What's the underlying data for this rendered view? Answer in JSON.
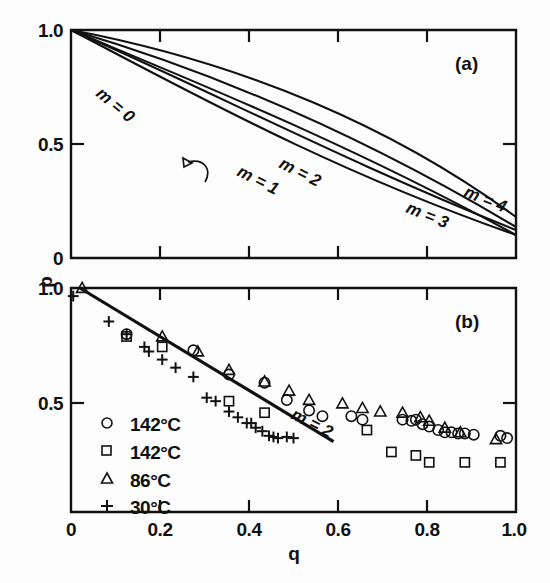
{
  "figure": {
    "panel_a_label": "(a)",
    "panel_b_label": "(b)",
    "y_axis_label": "p",
    "x_axis_label": "q"
  },
  "panel_a": {
    "y_ticks": [
      "1.0",
      "0.5",
      "0"
    ],
    "y_tick_values": [
      1.0,
      0.5,
      0.0
    ],
    "x_tick_values": [
      0.0,
      0.2,
      0.4,
      0.6,
      0.8,
      1.0
    ],
    "curve_labels": [
      "m = 0",
      "m = 1",
      "m = 2",
      "m = 3",
      "m = 4"
    ]
  },
  "panel_b": {
    "y_ticks": [
      "1.0",
      "0.5"
    ],
    "y_tick_values": [
      1.0,
      0.5
    ],
    "x_ticks": [
      "0",
      "0.2",
      "0.4",
      "0.6",
      "0.8",
      "1.0"
    ],
    "x_tick_values": [
      0.0,
      0.2,
      0.4,
      0.6,
      0.8,
      1.0
    ],
    "fit_label": "m = 2",
    "legend": [
      {
        "marker": "circle-marker",
        "label": "142°C"
      },
      {
        "marker": "square-marker",
        "label": "142°C"
      },
      {
        "marker": "triangle-marker",
        "label": "86°C"
      },
      {
        "marker": "plus-marker",
        "label": "30°C"
      }
    ]
  },
  "chart_data": {
    "type": "line",
    "title": "",
    "xlabel": "q",
    "ylabel": "p",
    "panels": [
      {
        "id": "a",
        "label": "(a)",
        "type": "line",
        "xlim": [
          0.0,
          1.0
        ],
        "ylim": [
          0.0,
          1.0
        ],
        "xticks": [
          0.0,
          0.2,
          0.4,
          0.6,
          0.8,
          1.0
        ],
        "yticks": [
          0.0,
          0.5,
          1.0
        ],
        "grid": false,
        "legend": "inline-curve-labels",
        "series": [
          {
            "name": "m = 0",
            "x": [
              0.0,
              0.1,
              0.2,
              0.3,
              0.4,
              0.5,
              0.6,
              0.7,
              0.8,
              0.9,
              1.0
            ],
            "y": [
              1.0,
              0.91,
              0.82,
              0.73,
              0.64,
              0.55,
              0.46,
              0.37,
              0.28,
              0.19,
              0.1
            ]
          },
          {
            "name": "m = 1",
            "x": [
              0.0,
              0.1,
              0.2,
              0.3,
              0.4,
              0.5,
              0.6,
              0.7,
              0.8,
              0.9,
              1.0
            ],
            "y": [
              1.0,
              0.895,
              0.79,
              0.685,
              0.575,
              0.47,
              0.375,
              0.29,
              0.215,
              0.155,
              0.1
            ]
          },
          {
            "name": "m = 2",
            "x": [
              0.0,
              0.1,
              0.2,
              0.3,
              0.4,
              0.5,
              0.6,
              0.7,
              0.8,
              0.9,
              1.0
            ],
            "y": [
              1.0,
              0.9,
              0.8,
              0.7,
              0.6,
              0.5,
              0.405,
              0.32,
              0.245,
              0.18,
              0.125
            ]
          },
          {
            "name": "m = 3",
            "x": [
              0.0,
              0.1,
              0.2,
              0.3,
              0.4,
              0.5,
              0.6,
              0.7,
              0.8,
              0.9,
              1.0
            ],
            "y": [
              1.0,
              0.915,
              0.83,
              0.745,
              0.66,
              0.575,
              0.485,
              0.395,
              0.305,
              0.22,
              0.135
            ]
          },
          {
            "name": "m = 4",
            "x": [
              0.0,
              0.1,
              0.2,
              0.3,
              0.4,
              0.5,
              0.6,
              0.7,
              0.8,
              0.9,
              1.0
            ],
            "y": [
              1.0,
              0.93,
              0.86,
              0.79,
              0.715,
              0.635,
              0.55,
              0.46,
              0.37,
              0.275,
              0.18
            ]
          }
        ]
      },
      {
        "id": "b",
        "label": "(b)",
        "type": "scatter",
        "xlim": [
          0.0,
          1.0
        ],
        "ylim": [
          0.03,
          1.0
        ],
        "xticks": [
          0.0,
          0.2,
          0.4,
          0.6,
          0.8,
          1.0
        ],
        "yticks": [
          0.5,
          1.0
        ],
        "grid": false,
        "legend_position": "lower-left",
        "fit_line": {
          "name": "m = 2",
          "x": [
            0.02,
            0.59
          ],
          "y": [
            1.0,
            0.335
          ]
        },
        "series": [
          {
            "name": "142°C",
            "marker": "circle",
            "x": [
              0.125,
              0.275,
              0.355,
              0.435,
              0.485,
              0.535,
              0.565,
              0.63,
              0.655,
              0.745,
              0.765,
              0.775,
              0.79,
              0.805,
              0.825,
              0.84,
              0.855,
              0.87,
              0.885,
              0.905,
              0.965,
              0.98
            ],
            "y": [
              0.8,
              0.73,
              0.625,
              0.59,
              0.515,
              0.47,
              0.445,
              0.445,
              0.43,
              0.43,
              0.425,
              0.43,
              0.41,
              0.4,
              0.385,
              0.375,
              0.375,
              0.37,
              0.37,
              0.365,
              0.36,
              0.35
            ]
          },
          {
            "name": "142°C",
            "marker": "square",
            "x": [
              0.125,
              0.205,
              0.355,
              0.435,
              0.665,
              0.72,
              0.775,
              0.805,
              0.885,
              0.965
            ],
            "y": [
              0.79,
              0.745,
              0.51,
              0.46,
              0.385,
              0.29,
              0.275,
              0.245,
              0.245,
              0.245
            ]
          },
          {
            "name": "86°C",
            "marker": "triangle",
            "x": [
              0.025,
              0.205,
              0.285,
              0.355,
              0.435,
              0.49,
              0.535,
              0.61,
              0.655,
              0.695,
              0.745,
              0.785,
              0.805,
              0.84,
              0.875,
              0.955
            ],
            "y": [
              1.0,
              0.79,
              0.725,
              0.645,
              0.595,
              0.555,
              0.515,
              0.5,
              0.48,
              0.465,
              0.46,
              0.44,
              0.425,
              0.395,
              0.375,
              0.345
            ]
          },
          {
            "name": "30°C",
            "marker": "plus",
            "x": [
              0.005,
              0.085,
              0.125,
              0.165,
              0.175,
              0.205,
              0.235,
              0.275,
              0.305,
              0.325,
              0.355,
              0.375,
              0.395,
              0.405,
              0.415,
              0.43,
              0.445,
              0.455,
              0.465,
              0.485,
              0.5
            ],
            "y": [
              0.965,
              0.855,
              0.8,
              0.745,
              0.725,
              0.69,
              0.655,
              0.615,
              0.525,
              0.51,
              0.465,
              0.44,
              0.415,
              0.415,
              0.395,
              0.38,
              0.36,
              0.355,
              0.35,
              0.355,
              0.35
            ]
          }
        ]
      }
    ]
  }
}
